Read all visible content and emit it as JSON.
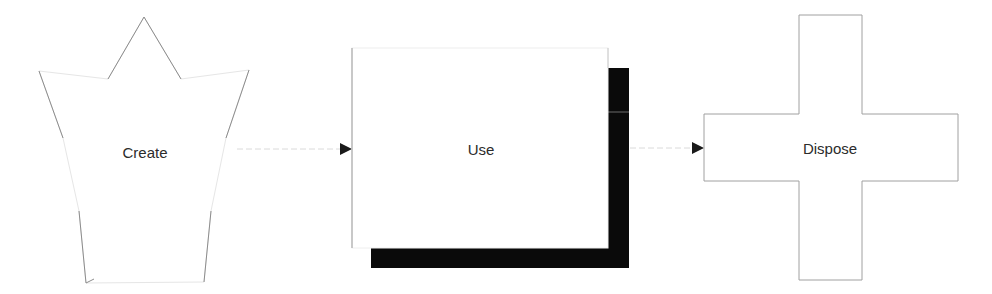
{
  "diagram": {
    "type": "flowchart",
    "nodes": [
      {
        "id": "create",
        "label": "Create",
        "shape": "star"
      },
      {
        "id": "use",
        "label": "Use",
        "shape": "rectangle-with-shadow"
      },
      {
        "id": "dispose",
        "label": "Dispose",
        "shape": "cross"
      }
    ],
    "edges": [
      {
        "from": "create",
        "to": "use"
      },
      {
        "from": "use",
        "to": "dispose"
      }
    ]
  },
  "colors": {
    "background": "#ffffff",
    "outline": "#9a9a9a",
    "faint_outline": "#dcdcdc",
    "shadow": "#0a0a0a",
    "arrowhead": "#1a1a1a",
    "connector": "#d8d8d8",
    "text": "#2b2b2b"
  }
}
